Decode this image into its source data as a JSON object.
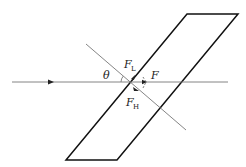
{
  "diagram": {
    "labels": {
      "theta": "θ",
      "f_l": "F",
      "f_l_sub": "L",
      "f": "F",
      "f_h": "F",
      "f_h_sub": "H"
    },
    "colors": {
      "slab": "#111111",
      "lines": "#777777",
      "text": "#222222"
    }
  }
}
